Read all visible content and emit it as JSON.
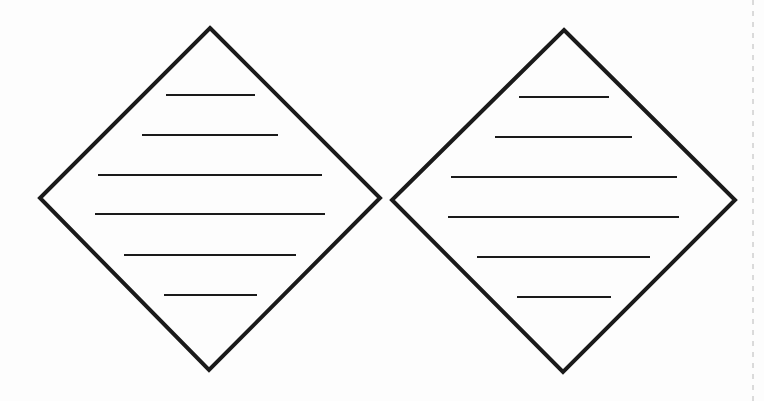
{
  "canvas": {
    "width": 764,
    "height": 401,
    "background": "#fdfdfd"
  },
  "colors": {
    "stroke": "#1a1a1a",
    "dashed": "#b8b8b8"
  },
  "diamonds": [
    {
      "name": "left-diamond",
      "vertices": {
        "top": [
          210,
          28
        ],
        "right": [
          380,
          198
        ],
        "bottom": [
          209,
          370
        ],
        "left": [
          40,
          198
        ]
      },
      "stroke_width": 4,
      "lines": [
        {
          "y": 95,
          "x1": 166,
          "x2": 255
        },
        {
          "y": 135,
          "x1": 142,
          "x2": 278
        },
        {
          "y": 175,
          "x1": 98,
          "x2": 322
        },
        {
          "y": 214,
          "x1": 95,
          "x2": 325
        },
        {
          "y": 255,
          "x1": 124,
          "x2": 296
        },
        {
          "y": 295,
          "x1": 164,
          "x2": 257
        }
      ]
    },
    {
      "name": "right-diamond",
      "vertices": {
        "top": [
          564,
          30
        ],
        "right": [
          735,
          200
        ],
        "bottom": [
          563,
          372
        ],
        "left": [
          392,
          200
        ]
      },
      "stroke_width": 4,
      "lines": [
        {
          "y": 97,
          "x1": 519,
          "x2": 609
        },
        {
          "y": 137,
          "x1": 495,
          "x2": 632
        },
        {
          "y": 177,
          "x1": 451,
          "x2": 677
        },
        {
          "y": 217,
          "x1": 448,
          "x2": 679
        },
        {
          "y": 257,
          "x1": 477,
          "x2": 650
        },
        {
          "y": 297,
          "x1": 517,
          "x2": 611
        }
      ]
    }
  ],
  "dashed_guide": {
    "x": 753,
    "y1": 0,
    "y2": 401
  }
}
